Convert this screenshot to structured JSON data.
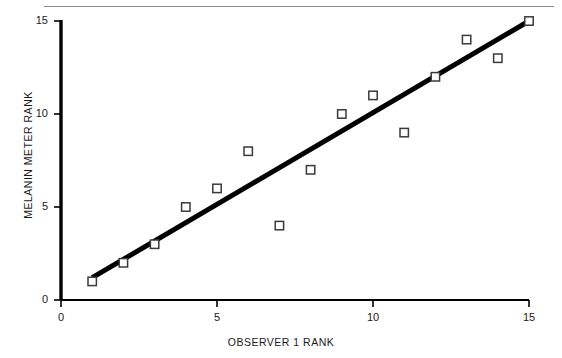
{
  "chart_data": {
    "type": "scatter",
    "title": "",
    "xlabel": "OBSERVER 1 RANK",
    "ylabel": "MELANIN METER RANK",
    "xlim": [
      0,
      15
    ],
    "ylim": [
      0,
      15
    ],
    "xticks": [
      0,
      5,
      10,
      15
    ],
    "yticks": [
      0,
      5,
      10,
      15
    ],
    "xtick_labels": [
      "0",
      "5",
      "10",
      "15"
    ],
    "ytick_labels": [
      "0",
      "5",
      "10",
      "15"
    ],
    "grid": false,
    "legend": "none",
    "marker": "open-square",
    "series": [
      {
        "name": "observations",
        "x": [
          1,
          2,
          3,
          4,
          5,
          6,
          7,
          8,
          9,
          10,
          11,
          12,
          13,
          14,
          15
        ],
        "y": [
          1,
          2,
          3,
          5,
          6,
          8,
          4,
          7,
          10,
          11,
          9,
          12,
          14,
          13,
          15
        ]
      }
    ],
    "trendline": {
      "name": "fit-line",
      "x": [
        1,
        15
      ],
      "y": [
        1.2,
        15.0
      ],
      "color": "#000000",
      "width": 5
    },
    "colors": {
      "axis": "#000000",
      "marker_edge": "#3a3a3a",
      "marker_fill": "#ffffff",
      "text": "#1a1a1a",
      "top_rule": "#8d8d8d"
    }
  },
  "axes": {
    "x_tick_labels": [
      "0",
      "5",
      "10",
      "15"
    ],
    "y_tick_labels": [
      "0",
      "5",
      "10",
      "15"
    ],
    "x_axis_title": "OBSERVER 1 RANK",
    "y_axis_title": "MELANIN METER RANK"
  }
}
